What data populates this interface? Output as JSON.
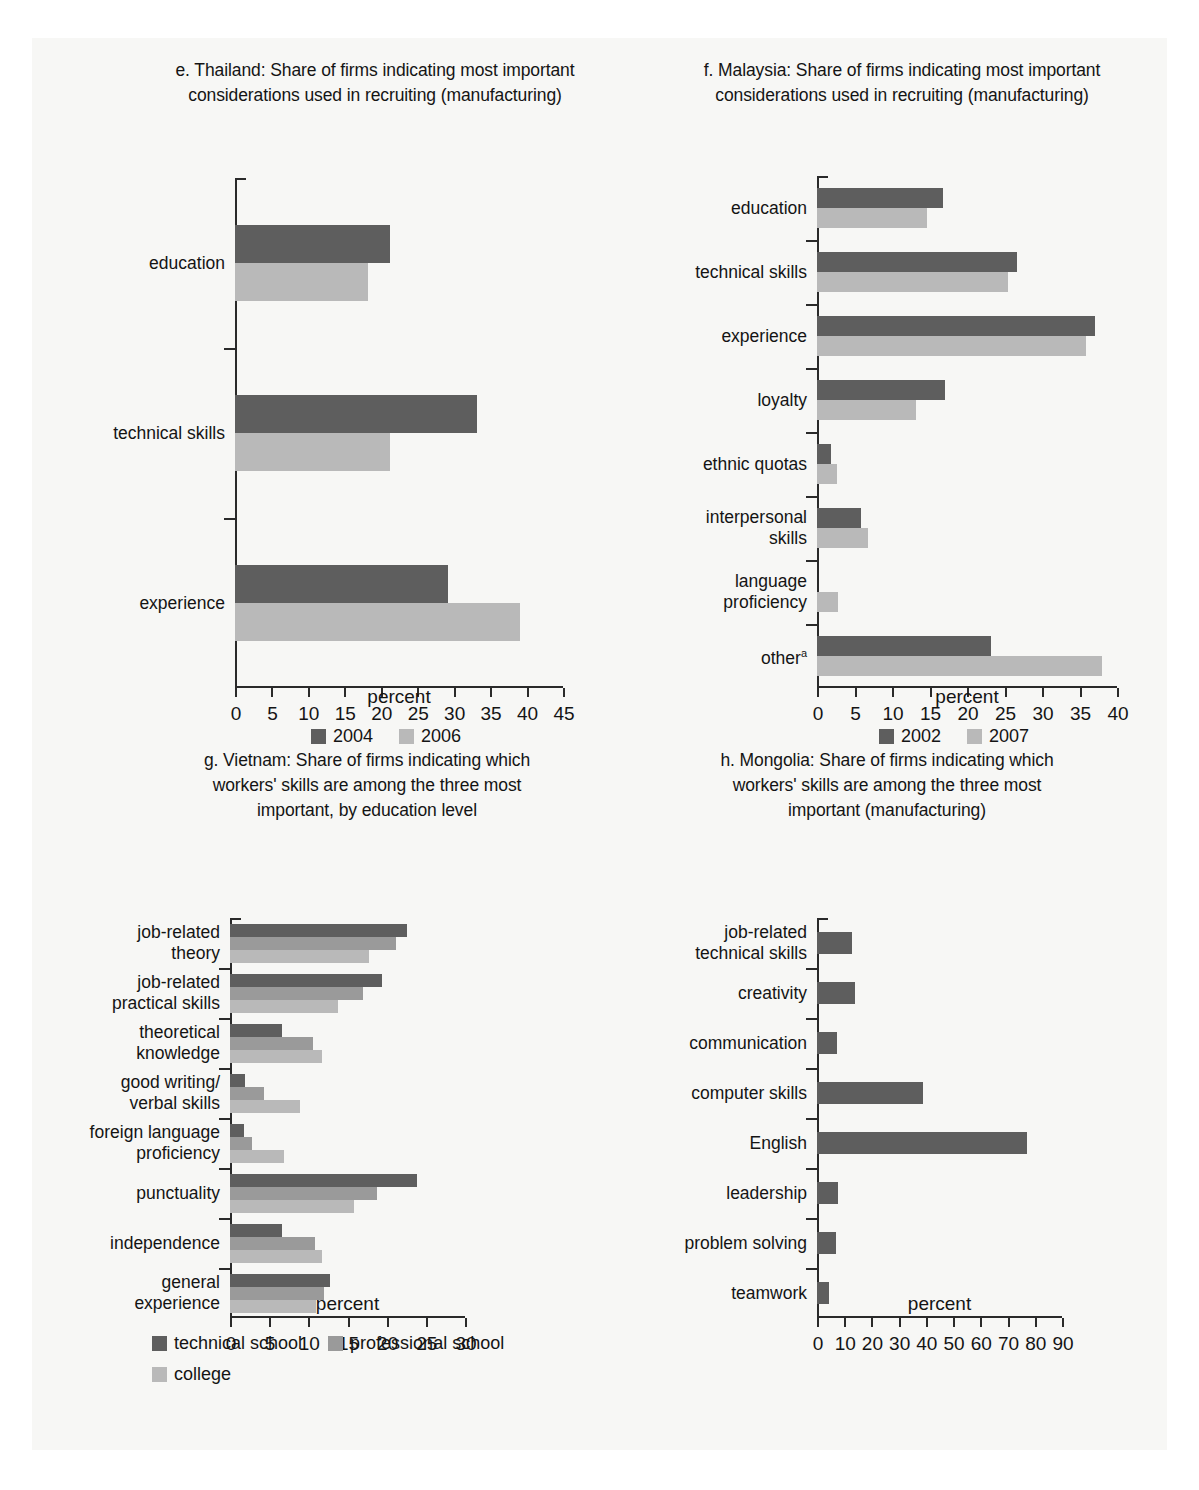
{
  "colors": {
    "dark": "#5e5e5e",
    "mid": "#9a9a9a",
    "light": "#b9b9b9",
    "axis": "#2a2a2a",
    "page_bg": "#f7f7f5"
  },
  "axis_title": "percent",
  "charts": [
    {
      "id": "thailand",
      "panel_label": "e.",
      "title_line1": "e. Thailand: Share of firms indicating most important",
      "title_line2": "considerations used in recruiting (manufacturing)",
      "chart_data": {
        "type": "bar",
        "orientation": "horizontal",
        "title": "e. Thailand: Share of firms indicating most important considerations used in recruiting (manufacturing)",
        "xlabel": "percent",
        "ylabel": "",
        "xlim": [
          0,
          45
        ],
        "xticks": [
          0,
          5,
          10,
          15,
          20,
          25,
          30,
          35,
          40,
          45
        ],
        "grid": false,
        "legend_position": "bottom",
        "categories": [
          "education",
          "technical skills",
          "experience"
        ],
        "series": [
          {
            "name": "2004",
            "color": "#5e5e5e",
            "values": [
              21.3,
              33.2,
              29.2
            ]
          },
          {
            "name": "2006",
            "color": "#b9b9b9",
            "values": [
              18.2,
              21.2,
              39.1
            ]
          }
        ]
      }
    },
    {
      "id": "malaysia",
      "panel_label": "f.",
      "title_line1": "f. Malaysia: Share of firms indicating most important",
      "title_line2": "considerations used in recruiting (manufacturing)",
      "chart_data": {
        "type": "bar",
        "orientation": "horizontal",
        "title": "f. Malaysia: Share of firms indicating most important considerations used in recruiting (manufacturing)",
        "xlabel": "percent",
        "ylabel": "",
        "xlim": [
          0,
          40
        ],
        "xticks": [
          0,
          5,
          10,
          15,
          20,
          25,
          30,
          35,
          40
        ],
        "grid": false,
        "legend_position": "bottom",
        "categories": [
          "education",
          "technical skills",
          "experience",
          "loyalty",
          "ethnic quotas",
          "interpersonal\nskills",
          "language\nproficiency",
          "other"
        ],
        "category_superscripts": [
          "",
          "",
          "",
          "",
          "",
          "",
          "",
          "a"
        ],
        "series": [
          {
            "name": "2002",
            "color": "#5e5e5e",
            "values": [
              16.8,
              26.6,
              37.0,
              17.0,
              1.8,
              5.9,
              0.0,
              23.2
            ]
          },
          {
            "name": "2007",
            "color": "#b9b9b9",
            "values": [
              14.6,
              25.5,
              35.9,
              13.2,
              2.6,
              6.8,
              2.8,
              38.0
            ]
          }
        ]
      }
    },
    {
      "id": "vietnam",
      "panel_label": "g.",
      "title_line1": "g. Vietnam: Share of firms indicating which",
      "title_line2": "workers' skills are among the three most",
      "title_line3": "important, by education level",
      "chart_data": {
        "type": "bar",
        "orientation": "horizontal",
        "title": "g. Vietnam: Share of firms indicating which workers' skills are among the three most important, by education level",
        "xlabel": "percent",
        "ylabel": "",
        "xlim": [
          0,
          30
        ],
        "xticks": [
          0,
          5,
          10,
          15,
          20,
          25,
          30
        ],
        "grid": false,
        "legend_position": "bottom",
        "categories": [
          "job-related\ntheory",
          "job-related\npractical skills",
          "theoretical\nknowledge",
          "good writing/\nverbal skills",
          "foreign language\nproficiency",
          "punctuality",
          "independence",
          "general\nexperience"
        ],
        "series": [
          {
            "name": "technical school",
            "color": "#5e5e5e",
            "values": [
              22.6,
              19.4,
              6.6,
              1.9,
              1.8,
              23.9,
              6.7,
              12.8
            ]
          },
          {
            "name": "professional school",
            "color": "#9a9a9a",
            "values": [
              21.2,
              17.0,
              10.6,
              4.3,
              2.8,
              18.8,
              10.8,
              12.0
            ]
          },
          {
            "name": "college",
            "color": "#b9b9b9",
            "values": [
              17.8,
              13.8,
              11.8,
              8.9,
              6.9,
              15.8,
              11.8,
              11.0
            ]
          }
        ]
      }
    },
    {
      "id": "mongolia",
      "panel_label": "h.",
      "title_line1": "h. Mongolia: Share of firms indicating which",
      "title_line2": "workers' skills are among the three most",
      "title_line3": "important (manufacturing)",
      "chart_data": {
        "type": "bar",
        "orientation": "horizontal",
        "title": "h. Mongolia: Share of firms indicating which workers' skills are among the three most important (manufacturing)",
        "xlabel": "percent",
        "ylabel": "",
        "xlim": [
          0,
          90
        ],
        "xticks": [
          0,
          10,
          20,
          30,
          40,
          50,
          60,
          70,
          80,
          90
        ],
        "grid": false,
        "legend_position": "none",
        "categories": [
          "job-related\ntechnical skills",
          "creativity",
          "communication",
          "computer skills",
          "English",
          "leadership",
          "problem solving",
          "teamwork"
        ],
        "series": [
          {
            "name": "share",
            "color": "#5e5e5e",
            "values": [
              13.0,
              13.8,
              7.5,
              38.8,
              77.0,
              7.8,
              6.8,
              4.5
            ]
          }
        ]
      }
    }
  ]
}
